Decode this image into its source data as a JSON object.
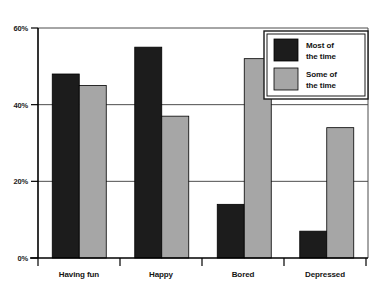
{
  "chart_data": {
    "type": "bar",
    "title": "",
    "subtitle": "",
    "xlabel": "",
    "ylabel": "",
    "categories": [
      "Having fun",
      "Happy",
      "Bored",
      "Depressed"
    ],
    "series": [
      {
        "name": "Most of the time",
        "color": "#1c1c1c",
        "values": [
          48,
          55,
          14,
          7
        ]
      },
      {
        "name": "Some of the time",
        "color": "#a6a6a6",
        "values": [
          45,
          37,
          52,
          34
        ]
      }
    ],
    "ylim": [
      0,
      60
    ],
    "yticks": [
      0,
      20,
      40,
      60
    ],
    "ytick_labels": [
      "0%",
      "20%",
      "40%",
      "60%"
    ],
    "grid": true,
    "grid_axis": "y",
    "legend_position": "top-right",
    "value_suffix": "%"
  },
  "axis": {
    "y_tick_0": "0%",
    "y_tick_1": "20%",
    "y_tick_2": "40%",
    "y_tick_3": "60%"
  },
  "categories": {
    "c0": "Having fun",
    "c1": "Happy",
    "c2": "Bored",
    "c3": "Depressed"
  },
  "legend": {
    "items": [
      {
        "line1": "Most of",
        "line2": "the time"
      },
      {
        "line1": "Some of",
        "line2": "the time"
      }
    ]
  },
  "colors": {
    "series_dark": "#1c1c1c",
    "series_light": "#a6a6a6",
    "axis": "#000000",
    "grid": "#4d4d4d",
    "background": "#ffffff"
  }
}
